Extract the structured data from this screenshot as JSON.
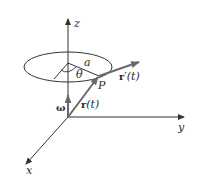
{
  "figure": {
    "axes": {
      "z_label": "z",
      "y_label": "y",
      "x_label": "x"
    },
    "circle": {
      "radius_label": "a",
      "angle_label": "θ"
    },
    "point_label": "P",
    "vectors": {
      "position_label_bold": "r",
      "position_label_rest": "(t)",
      "velocity_label_bold": "r",
      "velocity_label_rest": "′(t)",
      "angular_velocity_label": "ω"
    },
    "colors": {
      "axis": "#333333",
      "vector": "#6a6a6a",
      "background": "#ffffff"
    }
  }
}
